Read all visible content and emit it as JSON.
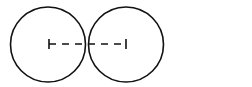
{
  "diagram": {
    "type": "two-tangent-circles",
    "stroke_color": "#111111",
    "background": "#ffffff",
    "circles": [
      {
        "name": "left-circle",
        "cx": 48,
        "cy": 44.5,
        "r": 37.5
      },
      {
        "name": "right-circle",
        "cx": 126,
        "cy": 44.5,
        "r": 37.5
      }
    ],
    "center_line": {
      "x1": 49,
      "y1": 44,
      "x2": 126,
      "y2": 44,
      "style": "dashed",
      "end_ticks": true
    }
  }
}
